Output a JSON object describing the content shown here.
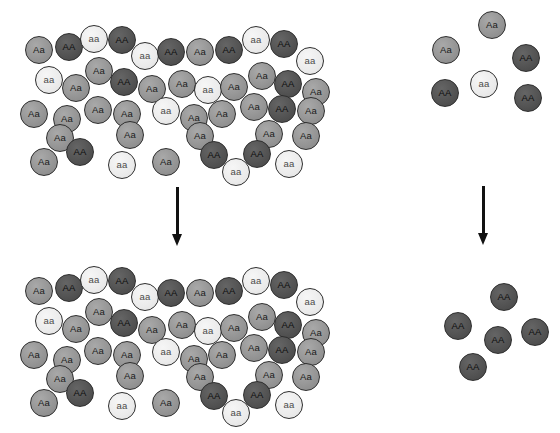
{
  "diagram": {
    "genotype_labels": {
      "heterozygote": "Aa",
      "homozygous_dominant": "AA",
      "homozygous_recessive": "aa"
    },
    "colors": {
      "heterozygote": "#979797",
      "homozygous_dominant": "#565656",
      "homozygous_recessive": "#eeeeee",
      "outline": "#2e2e2e",
      "arrow": "#111111",
      "background": "#ffffff"
    },
    "populations": [
      {
        "name": "large-population-before",
        "position": "top-left",
        "count": 45,
        "counts_by_genotype": {
          "Aa": 24,
          "AA": 11,
          "aa": 10
        },
        "circles": [
          {
            "label": "Aa",
            "type": "heterozygote",
            "x": 25,
            "y": 36
          },
          {
            "label": "AA",
            "type": "homozygous_dominant",
            "x": 55,
            "y": 33
          },
          {
            "label": "aa",
            "type": "homozygous_recessive",
            "x": 80,
            "y": 25
          },
          {
            "label": "AA",
            "type": "homozygous_dominant",
            "x": 108,
            "y": 26
          },
          {
            "label": "aa",
            "type": "homozygous_recessive",
            "x": 131,
            "y": 42
          },
          {
            "label": "AA",
            "type": "homozygous_dominant",
            "x": 157,
            "y": 38
          },
          {
            "label": "Aa",
            "type": "heterozygote",
            "x": 186,
            "y": 38
          },
          {
            "label": "AA",
            "type": "homozygous_dominant",
            "x": 215,
            "y": 36
          },
          {
            "label": "aa",
            "type": "homozygous_recessive",
            "x": 242,
            "y": 26
          },
          {
            "label": "AA",
            "type": "homozygous_dominant",
            "x": 270,
            "y": 30
          },
          {
            "label": "aa",
            "type": "homozygous_recessive",
            "x": 296,
            "y": 47
          },
          {
            "label": "Aa",
            "type": "heterozygote",
            "x": 85,
            "y": 57
          },
          {
            "label": "aa",
            "type": "homozygous_recessive",
            "x": 35,
            "y": 66
          },
          {
            "label": "Aa",
            "type": "heterozygote",
            "x": 62,
            "y": 74
          },
          {
            "label": "AA",
            "type": "homozygous_dominant",
            "x": 110,
            "y": 68
          },
          {
            "label": "Aa",
            "type": "heterozygote",
            "x": 138,
            "y": 75
          },
          {
            "label": "Aa",
            "type": "heterozygote",
            "x": 168,
            "y": 70
          },
          {
            "label": "aa",
            "type": "homozygous_recessive",
            "x": 194,
            "y": 76
          },
          {
            "label": "Aa",
            "type": "heterozygote",
            "x": 220,
            "y": 73
          },
          {
            "label": "Aa",
            "type": "heterozygote",
            "x": 248,
            "y": 62
          },
          {
            "label": "AA",
            "type": "homozygous_dominant",
            "x": 274,
            "y": 70
          },
          {
            "label": "Aa",
            "type": "heterozygote",
            "x": 302,
            "y": 78
          },
          {
            "label": "Aa",
            "type": "heterozygote",
            "x": 20,
            "y": 100
          },
          {
            "label": "Aa",
            "type": "heterozygote",
            "x": 53,
            "y": 105
          },
          {
            "label": "Aa",
            "type": "heterozygote",
            "x": 84,
            "y": 96
          },
          {
            "label": "Aa",
            "type": "heterozygote",
            "x": 113,
            "y": 100
          },
          {
            "label": "aa",
            "type": "homozygous_recessive",
            "x": 152,
            "y": 97
          },
          {
            "label": "Aa",
            "type": "heterozygote",
            "x": 180,
            "y": 104
          },
          {
            "label": "Aa",
            "type": "heterozygote",
            "x": 208,
            "y": 100
          },
          {
            "label": "Aa",
            "type": "heterozygote",
            "x": 240,
            "y": 93
          },
          {
            "label": "AA",
            "type": "homozygous_dominant",
            "x": 268,
            "y": 95
          },
          {
            "label": "Aa",
            "type": "heterozygote",
            "x": 297,
            "y": 97
          },
          {
            "label": "Aa",
            "type": "heterozygote",
            "x": 46,
            "y": 124
          },
          {
            "label": "Aa",
            "type": "heterozygote",
            "x": 116,
            "y": 121
          },
          {
            "label": "Aa",
            "type": "heterozygote",
            "x": 186,
            "y": 122
          },
          {
            "label": "Aa",
            "type": "heterozygote",
            "x": 255,
            "y": 120
          },
          {
            "label": "Aa",
            "type": "heterozygote",
            "x": 292,
            "y": 122
          },
          {
            "label": "AA",
            "type": "homozygous_dominant",
            "x": 66,
            "y": 138
          },
          {
            "label": "AA",
            "type": "homozygous_dominant",
            "x": 200,
            "y": 141
          },
          {
            "label": "AA",
            "type": "homozygous_dominant",
            "x": 243,
            "y": 140
          },
          {
            "label": "Aa",
            "type": "heterozygote",
            "x": 30,
            "y": 148
          },
          {
            "label": "aa",
            "type": "homozygous_recessive",
            "x": 108,
            "y": 151
          },
          {
            "label": "Aa",
            "type": "heterozygote",
            "x": 152,
            "y": 148
          },
          {
            "label": "aa",
            "type": "homozygous_recessive",
            "x": 222,
            "y": 158
          },
          {
            "label": "aa",
            "type": "homozygous_recessive",
            "x": 275,
            "y": 150
          }
        ]
      },
      {
        "name": "small-population-before",
        "position": "top-right",
        "count": 6,
        "counts_by_genotype": {
          "Aa": 2,
          "AA": 3,
          "aa": 1
        },
        "circles": [
          {
            "label": "Aa",
            "type": "heterozygote",
            "x": 478,
            "y": 11
          },
          {
            "label": "Aa",
            "type": "heterozygote",
            "x": 432,
            "y": 36
          },
          {
            "label": "AA",
            "type": "homozygous_dominant",
            "x": 512,
            "y": 44
          },
          {
            "label": "AA",
            "type": "homozygous_dominant",
            "x": 431,
            "y": 79
          },
          {
            "label": "aa",
            "type": "homozygous_recessive",
            "x": 470,
            "y": 70
          },
          {
            "label": "AA",
            "type": "homozygous_dominant",
            "x": 514,
            "y": 84
          }
        ]
      },
      {
        "name": "large-population-after",
        "position": "bottom-left",
        "count": 45,
        "counts_by_genotype": {
          "Aa": 24,
          "AA": 11,
          "aa": 10
        },
        "circles": [
          {
            "label": "Aa",
            "type": "heterozygote",
            "x": 25,
            "y": 277
          },
          {
            "label": "AA",
            "type": "homozygous_dominant",
            "x": 55,
            "y": 274
          },
          {
            "label": "aa",
            "type": "homozygous_recessive",
            "x": 80,
            "y": 266
          },
          {
            "label": "AA",
            "type": "homozygous_dominant",
            "x": 108,
            "y": 267
          },
          {
            "label": "aa",
            "type": "homozygous_recessive",
            "x": 131,
            "y": 283
          },
          {
            "label": "AA",
            "type": "homozygous_dominant",
            "x": 157,
            "y": 279
          },
          {
            "label": "Aa",
            "type": "heterozygote",
            "x": 186,
            "y": 279
          },
          {
            "label": "AA",
            "type": "homozygous_dominant",
            "x": 215,
            "y": 277
          },
          {
            "label": "aa",
            "type": "homozygous_recessive",
            "x": 242,
            "y": 267
          },
          {
            "label": "AA",
            "type": "homozygous_dominant",
            "x": 270,
            "y": 271
          },
          {
            "label": "aa",
            "type": "homozygous_recessive",
            "x": 296,
            "y": 288
          },
          {
            "label": "Aa",
            "type": "heterozygote",
            "x": 85,
            "y": 298
          },
          {
            "label": "aa",
            "type": "homozygous_recessive",
            "x": 35,
            "y": 307
          },
          {
            "label": "Aa",
            "type": "heterozygote",
            "x": 62,
            "y": 315
          },
          {
            "label": "AA",
            "type": "homozygous_dominant",
            "x": 110,
            "y": 309
          },
          {
            "label": "Aa",
            "type": "heterozygote",
            "x": 138,
            "y": 316
          },
          {
            "label": "Aa",
            "type": "heterozygote",
            "x": 168,
            "y": 311
          },
          {
            "label": "aa",
            "type": "homozygous_recessive",
            "x": 194,
            "y": 317
          },
          {
            "label": "Aa",
            "type": "heterozygote",
            "x": 220,
            "y": 314
          },
          {
            "label": "Aa",
            "type": "heterozygote",
            "x": 248,
            "y": 303
          },
          {
            "label": "AA",
            "type": "homozygous_dominant",
            "x": 274,
            "y": 311
          },
          {
            "label": "Aa",
            "type": "heterozygote",
            "x": 302,
            "y": 319
          },
          {
            "label": "Aa",
            "type": "heterozygote",
            "x": 20,
            "y": 341
          },
          {
            "label": "Aa",
            "type": "heterozygote",
            "x": 53,
            "y": 346
          },
          {
            "label": "Aa",
            "type": "heterozygote",
            "x": 84,
            "y": 337
          },
          {
            "label": "Aa",
            "type": "heterozygote",
            "x": 113,
            "y": 341
          },
          {
            "label": "aa",
            "type": "homozygous_recessive",
            "x": 152,
            "y": 338
          },
          {
            "label": "Aa",
            "type": "heterozygote",
            "x": 180,
            "y": 345
          },
          {
            "label": "Aa",
            "type": "heterozygote",
            "x": 208,
            "y": 341
          },
          {
            "label": "Aa",
            "type": "heterozygote",
            "x": 240,
            "y": 334
          },
          {
            "label": "AA",
            "type": "homozygous_dominant",
            "x": 268,
            "y": 336
          },
          {
            "label": "Aa",
            "type": "heterozygote",
            "x": 297,
            "y": 338
          },
          {
            "label": "Aa",
            "type": "heterozygote",
            "x": 46,
            "y": 365
          },
          {
            "label": "Aa",
            "type": "heterozygote",
            "x": 116,
            "y": 362
          },
          {
            "label": "Aa",
            "type": "heterozygote",
            "x": 186,
            "y": 363
          },
          {
            "label": "Aa",
            "type": "heterozygote",
            "x": 255,
            "y": 361
          },
          {
            "label": "Aa",
            "type": "heterozygote",
            "x": 292,
            "y": 363
          },
          {
            "label": "AA",
            "type": "homozygous_dominant",
            "x": 66,
            "y": 379
          },
          {
            "label": "AA",
            "type": "homozygous_dominant",
            "x": 200,
            "y": 382
          },
          {
            "label": "AA",
            "type": "homozygous_dominant",
            "x": 243,
            "y": 381
          },
          {
            "label": "Aa",
            "type": "heterozygote",
            "x": 30,
            "y": 389
          },
          {
            "label": "aa",
            "type": "homozygous_recessive",
            "x": 108,
            "y": 392
          },
          {
            "label": "Aa",
            "type": "heterozygote",
            "x": 152,
            "y": 389
          },
          {
            "label": "aa",
            "type": "homozygous_recessive",
            "x": 222,
            "y": 399
          },
          {
            "label": "aa",
            "type": "homozygous_recessive",
            "x": 275,
            "y": 391
          }
        ]
      },
      {
        "name": "small-population-after",
        "position": "bottom-right",
        "count": 5,
        "counts_by_genotype": {
          "Aa": 0,
          "AA": 5,
          "aa": 0
        },
        "circles": [
          {
            "label": "AA",
            "type": "homozygous_dominant",
            "x": 490,
            "y": 283
          },
          {
            "label": "AA",
            "type": "homozygous_dominant",
            "x": 444,
            "y": 312
          },
          {
            "label": "AA",
            "type": "homozygous_dominant",
            "x": 521,
            "y": 318
          },
          {
            "label": "AA",
            "type": "homozygous_dominant",
            "x": 484,
            "y": 326
          },
          {
            "label": "AA",
            "type": "homozygous_dominant",
            "x": 459,
            "y": 353
          }
        ]
      }
    ],
    "arrows": [
      {
        "name": "arrow-large-population",
        "x": 176,
        "y": 187,
        "length": 58
      },
      {
        "name": "arrow-small-population",
        "x": 482,
        "y": 186,
        "length": 58
      }
    ]
  }
}
